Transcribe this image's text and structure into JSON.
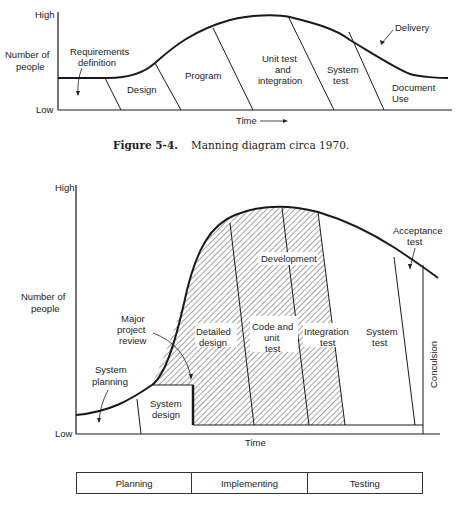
{
  "figure1": {
    "y_axis": {
      "high": "High",
      "low": "Low",
      "label_line1": "Number of",
      "label_line2": "people"
    },
    "x_axis": {
      "label": "Time",
      "arrow": "→"
    },
    "phases": {
      "requirements_1": "Requirements",
      "requirements_2": "definition",
      "design": "Design",
      "program": "Program",
      "unit_1": "Unit test",
      "unit_2": "and",
      "unit_3": "integration",
      "system_1": "System",
      "system_2": "test",
      "doc_1": "Document",
      "doc_2": "Use"
    },
    "annotation": "Delivery",
    "caption_number": "Figure 5-4.",
    "caption_text": "Manning diagram circa 1970."
  },
  "figure2": {
    "y_axis": {
      "high": "High",
      "low": "Low",
      "label_line1": "Number of",
      "label_line2": "people"
    },
    "x_axis": {
      "label": "Time"
    },
    "phases": {
      "planning_1": "System",
      "planning_2": "planning",
      "sysdesign_1": "System",
      "sysdesign_2": "design",
      "detailed_1": "Detailed",
      "detailed_2": "design",
      "code_1": "Code and",
      "code_2": "unit",
      "code_3": "test",
      "integ_1": "Integration",
      "integ_2": "test",
      "systest_1": "System",
      "systest_2": "test",
      "development": "Development",
      "conclusion": "Conculsion"
    },
    "annotations": {
      "review_1": "Major",
      "review_2": "project",
      "review_3": "review",
      "acceptance_1": "Acceptance",
      "acceptance_2": "test"
    },
    "phase_bar": [
      "Planning",
      "Implementing",
      "Testing"
    ]
  }
}
